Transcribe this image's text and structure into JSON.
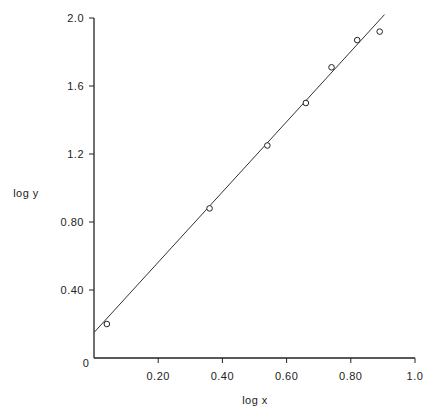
{
  "chart_data": {
    "type": "scatter",
    "title": "",
    "xlabel": "log x",
    "ylabel": "log y",
    "xlim": [
      0,
      1.0
    ],
    "ylim": [
      0,
      2.0
    ],
    "grid": false,
    "legend": null,
    "x_ticks": [
      {
        "value": 0,
        "label": "0"
      },
      {
        "value": 0.2,
        "label": "0.20"
      },
      {
        "value": 0.4,
        "label": "0.40"
      },
      {
        "value": 0.6,
        "label": "0.60"
      },
      {
        "value": 0.8,
        "label": "0.80"
      },
      {
        "value": 1.0,
        "label": "1.0"
      }
    ],
    "y_ticks": [
      {
        "value": 0.4,
        "label": "0.40"
      },
      {
        "value": 0.8,
        "label": "0.80"
      },
      {
        "value": 1.2,
        "label": "1.2"
      },
      {
        "value": 1.6,
        "label": "1.6"
      },
      {
        "value": 2.0,
        "label": "2.0"
      }
    ],
    "series": [
      {
        "name": "data",
        "marker": "open-circle",
        "points": [
          {
            "x": 0.04,
            "y": 0.2
          },
          {
            "x": 0.36,
            "y": 0.88
          },
          {
            "x": 0.54,
            "y": 1.25
          },
          {
            "x": 0.66,
            "y": 1.5
          },
          {
            "x": 0.74,
            "y": 1.71
          },
          {
            "x": 0.82,
            "y": 1.87
          },
          {
            "x": 0.89,
            "y": 1.92
          }
        ]
      },
      {
        "name": "fit",
        "type": "line",
        "points": [
          {
            "x": 0.0,
            "y": 0.15
          },
          {
            "x": 0.905,
            "y": 2.02
          }
        ]
      }
    ]
  }
}
